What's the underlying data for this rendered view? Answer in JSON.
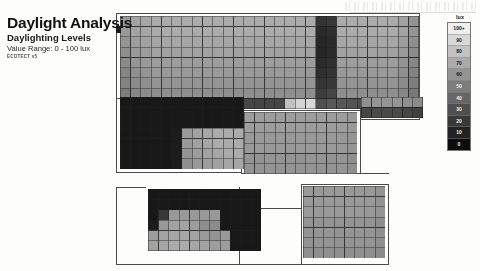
{
  "header": {
    "title": "Daylight Analysis",
    "subtitle": "Daylighting Levels",
    "range_line": "Value Range: 0 - 100 lux",
    "credit": "ECOTECT v5"
  },
  "legend": {
    "unit_label": "lux",
    "entries": [
      {
        "label": "100+",
        "color": "#efefef"
      },
      {
        "label": "90",
        "color": "#d8d8d8"
      },
      {
        "label": "80",
        "color": "#c2c2c2"
      },
      {
        "label": "70",
        "color": "#ababab"
      },
      {
        "label": "60",
        "color": "#949494"
      },
      {
        "label": "50",
        "color": "#7d7d7d"
      },
      {
        "label": "40",
        "color": "#666666"
      },
      {
        "label": "30",
        "color": "#4f4f4f"
      },
      {
        "label": "20",
        "color": "#383838"
      },
      {
        "label": "10",
        "color": "#222222"
      },
      {
        "label": "0",
        "color": "#0d0d0d"
      }
    ]
  },
  "chart_data": {
    "type": "heatmap",
    "title": "Daylight Analysis",
    "subtitle": "Daylighting Levels",
    "xlabel": "",
    "ylabel": "",
    "value_unit": "lux",
    "value_range": [
      0,
      100
    ],
    "colormap": "grayscale-dark-to-light",
    "legend_position": "right",
    "grid": true,
    "annotation": "Value Range: 0 - 100 lux",
    "regions": [
      {
        "name": "upper-main-floor",
        "x": 120,
        "y": 16,
        "cell": 10.3,
        "cols": 29,
        "rows": 9,
        "values": [
          [
            62,
            66,
            68,
            70,
            70,
            70,
            70,
            70,
            70,
            70,
            70,
            70,
            70,
            70,
            70,
            70,
            70,
            70,
            70,
            18,
            20,
            70,
            70,
            70,
            70,
            70,
            70,
            66,
            60
          ],
          [
            62,
            66,
            68,
            70,
            70,
            70,
            70,
            70,
            70,
            70,
            70,
            70,
            70,
            70,
            70,
            70,
            70,
            70,
            70,
            14,
            16,
            70,
            70,
            70,
            70,
            70,
            70,
            66,
            60
          ],
          [
            60,
            64,
            66,
            68,
            68,
            68,
            68,
            68,
            68,
            68,
            68,
            68,
            68,
            68,
            68,
            68,
            68,
            68,
            68,
            12,
            14,
            68,
            68,
            68,
            68,
            68,
            68,
            64,
            58
          ],
          [
            58,
            62,
            64,
            66,
            66,
            66,
            66,
            66,
            66,
            66,
            66,
            66,
            66,
            66,
            66,
            66,
            66,
            66,
            66,
            12,
            14,
            66,
            66,
            66,
            66,
            66,
            66,
            62,
            56
          ],
          [
            56,
            60,
            62,
            64,
            64,
            64,
            64,
            64,
            64,
            64,
            64,
            64,
            64,
            64,
            64,
            64,
            64,
            64,
            64,
            14,
            16,
            64,
            64,
            64,
            64,
            64,
            64,
            60,
            54
          ],
          [
            54,
            58,
            60,
            62,
            62,
            62,
            62,
            62,
            62,
            62,
            62,
            62,
            62,
            62,
            62,
            62,
            62,
            62,
            62,
            16,
            18,
            62,
            62,
            62,
            62,
            62,
            62,
            58,
            52
          ],
          [
            52,
            56,
            58,
            60,
            60,
            60,
            60,
            60,
            60,
            60,
            60,
            60,
            60,
            60,
            60,
            60,
            60,
            60,
            60,
            18,
            20,
            60,
            60,
            60,
            60,
            60,
            60,
            56,
            50
          ],
          [
            50,
            54,
            56,
            58,
            58,
            58,
            58,
            58,
            58,
            58,
            58,
            58,
            58,
            58,
            58,
            58,
            58,
            58,
            58,
            22,
            26,
            58,
            58,
            58,
            58,
            58,
            58,
            54,
            48
          ],
          [
            20,
            22,
            24,
            26,
            26,
            26,
            26,
            26,
            26,
            26,
            26,
            26,
            26,
            26,
            26,
            26,
            80,
            88,
            90,
            30,
            34,
            34,
            32,
            30,
            28,
            26,
            24,
            22,
            18
          ]
        ]
      },
      {
        "name": "left-dark-wing",
        "x": 120,
        "y": 97,
        "cell": 10.3,
        "cols": 12,
        "rows": 7,
        "values": [
          [
            6,
            6,
            6,
            6,
            6,
            6,
            6,
            6,
            6,
            6,
            6,
            6
          ],
          [
            6,
            6,
            6,
            6,
            6,
            6,
            6,
            6,
            6,
            6,
            6,
            6
          ],
          [
            6,
            6,
            6,
            6,
            6,
            6,
            6,
            6,
            6,
            6,
            6,
            6
          ],
          [
            6,
            6,
            6,
            6,
            6,
            8,
            62,
            66,
            68,
            70,
            70,
            70
          ],
          [
            6,
            6,
            6,
            6,
            6,
            8,
            62,
            66,
            68,
            70,
            70,
            70
          ],
          [
            6,
            6,
            6,
            6,
            6,
            8,
            60,
            64,
            66,
            68,
            70,
            70
          ],
          [
            6,
            6,
            6,
            6,
            6,
            8,
            58,
            62,
            64,
            66,
            68,
            68
          ]
        ]
      },
      {
        "name": "center-room",
        "x": 244,
        "y": 112,
        "cell": 10.3,
        "cols": 11,
        "rows": 6,
        "values": [
          [
            64,
            64,
            64,
            64,
            64,
            64,
            64,
            64,
            64,
            64,
            62
          ],
          [
            64,
            64,
            64,
            64,
            64,
            64,
            64,
            64,
            64,
            64,
            62
          ],
          [
            62,
            62,
            62,
            62,
            62,
            62,
            62,
            62,
            62,
            62,
            60
          ],
          [
            62,
            62,
            62,
            62,
            62,
            62,
            62,
            62,
            62,
            62,
            60
          ],
          [
            60,
            60,
            60,
            60,
            60,
            60,
            60,
            60,
            60,
            60,
            58
          ],
          [
            60,
            60,
            60,
            60,
            60,
            60,
            60,
            60,
            60,
            60,
            58
          ]
        ]
      },
      {
        "name": "lower-left-room",
        "x": 148,
        "y": 189,
        "cell": 10.3,
        "cols": 11,
        "rows": 6,
        "values": [
          [
            6,
            6,
            6,
            6,
            6,
            6,
            6,
            6,
            6,
            6,
            6
          ],
          [
            6,
            6,
            6,
            6,
            6,
            6,
            6,
            6,
            6,
            6,
            6
          ],
          [
            6,
            20,
            62,
            62,
            62,
            62,
            62,
            6,
            6,
            6,
            6
          ],
          [
            8,
            62,
            66,
            66,
            64,
            58,
            56,
            6,
            6,
            6,
            6
          ],
          [
            64,
            66,
            68,
            68,
            66,
            62,
            60,
            62,
            6,
            6,
            6
          ],
          [
            66,
            68,
            70,
            70,
            68,
            66,
            64,
            64,
            6,
            6,
            6
          ]
        ]
      },
      {
        "name": "lower-right-room",
        "x": 303,
        "y": 186,
        "cell": 10.3,
        "cols": 8,
        "rows": 7,
        "values": [
          [
            62,
            62,
            62,
            62,
            62,
            62,
            62,
            60
          ],
          [
            62,
            62,
            62,
            62,
            62,
            62,
            62,
            60
          ],
          [
            62,
            62,
            62,
            62,
            62,
            62,
            62,
            60
          ],
          [
            60,
            60,
            60,
            60,
            60,
            60,
            60,
            58
          ],
          [
            60,
            60,
            60,
            60,
            60,
            60,
            60,
            58
          ],
          [
            60,
            60,
            60,
            60,
            60,
            60,
            60,
            58
          ],
          [
            58,
            58,
            58,
            58,
            58,
            58,
            58,
            56
          ]
        ]
      },
      {
        "name": "right-upper-strip",
        "x": 361,
        "y": 97,
        "cell": 10.3,
        "cols": 6,
        "rows": 2,
        "values": [
          [
            58,
            60,
            60,
            60,
            58,
            56
          ],
          [
            26,
            28,
            28,
            28,
            26,
            24
          ]
        ]
      }
    ],
    "walls": [
      {
        "x": 116,
        "y": 13,
        "w": 304,
        "h": 1
      },
      {
        "x": 116,
        "y": 13,
        "w": 1,
        "h": 86
      },
      {
        "x": 419,
        "y": 13,
        "w": 1,
        "h": 86
      },
      {
        "x": 116,
        "y": 98,
        "w": 304,
        "h": 1
      },
      {
        "x": 116,
        "y": 98,
        "w": 1,
        "h": 75
      },
      {
        "x": 116,
        "y": 172,
        "w": 126,
        "h": 1
      },
      {
        "x": 241,
        "y": 110,
        "w": 1,
        "h": 63
      },
      {
        "x": 241,
        "y": 110,
        "w": 120,
        "h": 1
      },
      {
        "x": 360,
        "y": 98,
        "w": 1,
        "h": 76
      },
      {
        "x": 241,
        "y": 173,
        "w": 120,
        "h": 1
      },
      {
        "x": 360,
        "y": 119,
        "w": 60,
        "h": 1
      },
      {
        "x": 419,
        "y": 98,
        "w": 1,
        "h": 22
      },
      {
        "x": 116,
        "y": 187,
        "w": 1,
        "h": 78
      },
      {
        "x": 116,
        "y": 264,
        "w": 206,
        "h": 1
      },
      {
        "x": 116,
        "y": 187,
        "w": 30,
        "h": 1
      },
      {
        "x": 239,
        "y": 187,
        "w": 1,
        "h": 78
      },
      {
        "x": 239,
        "y": 208,
        "w": 63,
        "h": 1
      },
      {
        "x": 301,
        "y": 184,
        "w": 1,
        "h": 81
      },
      {
        "x": 301,
        "y": 184,
        "w": 88,
        "h": 1
      },
      {
        "x": 388,
        "y": 184,
        "w": 1,
        "h": 81
      },
      {
        "x": 301,
        "y": 264,
        "w": 88,
        "h": 1
      },
      {
        "x": 360,
        "y": 173,
        "w": 29,
        "h": 1
      }
    ]
  }
}
